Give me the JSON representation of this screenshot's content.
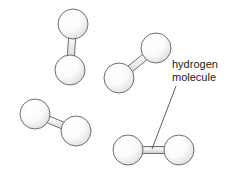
{
  "figure": {
    "background_color": "#ffffff",
    "width": 232,
    "height": 177
  },
  "style": {
    "atom_fill_light": "#ffffff",
    "atom_fill_shadow": "#d8d8d8",
    "atom_outline": "#6e6e6e",
    "bond_fill_light": "#f2f2f2",
    "bond_fill_shadow": "#c9c9c9",
    "bond_outline": "#6e6e6e",
    "leader_color": "#4a4a4a",
    "text_color": "#1b1b1b"
  },
  "label": {
    "name": "hydrogen-molecule-label",
    "line1": "hydrogen",
    "line2": "molecule",
    "x": 172,
    "y_line1": 68,
    "y_line2": 81
  },
  "leader": {
    "name": "label-leader-line",
    "x1": 176,
    "y1": 86,
    "x2": 152,
    "y2": 149
  },
  "molecules": [
    {
      "id": "molecule-top-left",
      "label": "hydrogen molecule",
      "orientation": "near-vertical",
      "atoms": [
        {
          "id": "atom-a",
          "element": "H",
          "cx": 73,
          "cy": 24,
          "r": 15
        },
        {
          "id": "atom-b",
          "element": "H",
          "cx": 70,
          "cy": 70,
          "r": 15
        }
      ],
      "bond": {
        "id": "bond",
        "order": 1,
        "half_width": 3.5
      }
    },
    {
      "id": "molecule-mid-right",
      "label": "hydrogen molecule",
      "orientation": "diagonal-up-right",
      "atoms": [
        {
          "id": "atom-a",
          "element": "H",
          "cx": 119,
          "cy": 78,
          "r": 15
        },
        {
          "id": "atom-b",
          "element": "H",
          "cx": 156,
          "cy": 48,
          "r": 15
        }
      ],
      "bond": {
        "id": "bond",
        "order": 1,
        "half_width": 3.5
      }
    },
    {
      "id": "molecule-bottom-left",
      "label": "hydrogen molecule",
      "orientation": "diagonal-down-right",
      "atoms": [
        {
          "id": "atom-a",
          "element": "H",
          "cx": 35,
          "cy": 114,
          "r": 15
        },
        {
          "id": "atom-b",
          "element": "H",
          "cx": 76,
          "cy": 131,
          "r": 15
        }
      ],
      "bond": {
        "id": "bond",
        "order": 1,
        "half_width": 3.5
      }
    },
    {
      "id": "molecule-bottom-right",
      "label": "hydrogen molecule",
      "orientation": "horizontal",
      "atoms": [
        {
          "id": "atom-a",
          "element": "H",
          "cx": 128,
          "cy": 150,
          "r": 15
        },
        {
          "id": "atom-b",
          "element": "H",
          "cx": 179,
          "cy": 150,
          "r": 15
        }
      ],
      "bond": {
        "id": "bond",
        "order": 1,
        "half_width": 3.5
      }
    }
  ]
}
